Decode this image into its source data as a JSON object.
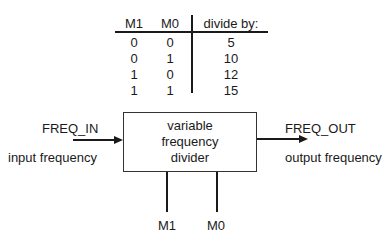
{
  "truth_table": {
    "headers": [
      "M1",
      "M0",
      "divide by:"
    ],
    "rows": [
      [
        "0",
        "0",
        "5"
      ],
      [
        "0",
        "1",
        "10"
      ],
      [
        "1",
        "0",
        "12"
      ],
      [
        "1",
        "1",
        "15"
      ]
    ]
  },
  "block": {
    "lines": [
      "variable",
      "frequency",
      "divider"
    ]
  },
  "input": {
    "signal": "FREQ_IN",
    "description": "input frequency"
  },
  "output": {
    "signal": "FREQ_OUT",
    "description": "output frequency"
  },
  "controls": [
    "M1",
    "M0"
  ],
  "colors": {
    "ink": "#1a1a1a",
    "background": "#ffffff"
  }
}
